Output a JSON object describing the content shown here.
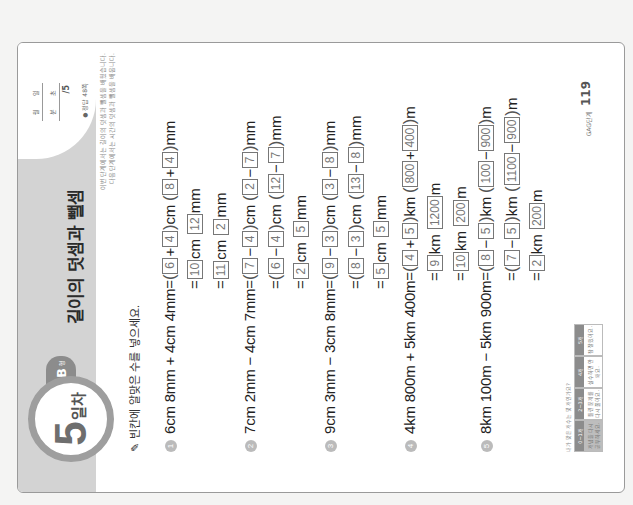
{
  "header": {
    "day_number": "5",
    "day_label": "일차",
    "type_letter": "B",
    "type_suffix": "형",
    "title": "길이의 덧셈과 뺄셈",
    "score": {
      "month_label": "월",
      "day_label": "일",
      "minute_label": "분",
      "second_label": "초",
      "total": "/5"
    },
    "answer_ref": "● 정답 48쪽",
    "intro_lines": [
      "이번 단계에서는 길이의 덧셈과 뺄셈을 배웠습니다.",
      "다음 단계에서는 시간의 덧셈과 뺄셈을 배웁니다."
    ]
  },
  "instruction": "빈칸에 알맞은 수를 넣으세요.",
  "problems": [
    {
      "number": "1",
      "expression": "6cm 8mm + 4cm 4mm",
      "steps": [
        {
          "a": "6",
          "op1": "+",
          "b": "4",
          "u1": "cm",
          "c": "8",
          "op2": "+",
          "d": "4",
          "u2": "mm"
        },
        {
          "a": "10",
          "u1": "cm",
          "c": "12",
          "u2": "mm"
        },
        {
          "a": "11",
          "u1": "cm",
          "c": "2",
          "u2": "mm"
        }
      ]
    },
    {
      "number": "2",
      "expression": "7cm 2mm − 4cm 7mm",
      "steps": [
        {
          "a": "7",
          "op1": "−",
          "b": "4",
          "u1": "cm",
          "c": "2",
          "op2": "−",
          "d": "7",
          "u2": "mm"
        },
        {
          "a": "6",
          "op1": "−",
          "b": "4",
          "u1": "cm",
          "c": "12",
          "op2": "−",
          "d": "7",
          "u2": "mm"
        },
        {
          "a": "2",
          "u1": "cm",
          "c": "5",
          "u2": "mm"
        }
      ]
    },
    {
      "number": "3",
      "expression": "9cm 3mm − 3cm 8mm",
      "steps": [
        {
          "a": "9",
          "op1": "−",
          "b": "3",
          "u1": "cm",
          "c": "3",
          "op2": "−",
          "d": "8",
          "u2": "mm"
        },
        {
          "a": "8",
          "op1": "−",
          "b": "3",
          "u1": "cm",
          "c": "13",
          "op2": "−",
          "d": "8",
          "u2": "mm"
        },
        {
          "a": "5",
          "u1": "cm",
          "c": "5",
          "u2": "mm"
        }
      ]
    },
    {
      "number": "4",
      "expression": "4km 800m + 5km 400m",
      "steps": [
        {
          "a": "4",
          "op1": "+",
          "b": "5",
          "u1": "km",
          "c": "800",
          "op2": "+",
          "d": "400",
          "u2": "m"
        },
        {
          "a": "9",
          "u1": "km",
          "c": "1200",
          "u2": "m"
        },
        {
          "a": "10",
          "u1": "km",
          "c": "200",
          "u2": "m"
        }
      ]
    },
    {
      "number": "5",
      "expression": "8km 100m − 5km 900m",
      "steps": [
        {
          "a": "8",
          "op1": "−",
          "b": "5",
          "u1": "km",
          "c": "100",
          "op2": "−",
          "d": "900",
          "u2": "m"
        },
        {
          "a": "7",
          "op1": "−",
          "b": "5",
          "u1": "km",
          "c": "1100",
          "op2": "−",
          "d": "900",
          "u2": "m"
        },
        {
          "a": "2",
          "u1": "km",
          "c": "200",
          "u2": "m"
        }
      ]
    }
  ],
  "footer": {
    "note": "내가 맞은 개수는 몇 개인가요?",
    "stages": [
      {
        "head": "0~1개",
        "body": "개념을 다시 공부하세요.",
        "active": true
      },
      {
        "head": "2~3개",
        "body": "틀린 문제를 다시 풀어요.",
        "active": false
      },
      {
        "head": "4개",
        "body": "실수하면 안 돼요.",
        "active": false
      },
      {
        "head": "5개",
        "body": "참 잘했어요.",
        "active": false
      }
    ],
    "page_label": "GAG단계",
    "page_number": "119"
  }
}
